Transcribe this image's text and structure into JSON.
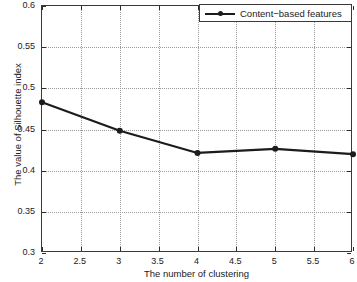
{
  "chart_data": {
    "type": "line",
    "title": "",
    "xlabel": "The number of clustering",
    "ylabel": "The value of Silhouette index",
    "xlim": [
      2,
      6
    ],
    "ylim": [
      0.3,
      0.6
    ],
    "grid": true,
    "legend_position": "top-right",
    "xticks": [
      "2",
      "2.5",
      "3",
      "3.5",
      "4",
      "4.5",
      "5",
      "5.5",
      "6"
    ],
    "xtick_values": [
      2,
      2.5,
      3,
      3.5,
      4,
      4.5,
      5,
      5.5,
      6
    ],
    "yticks": [
      "0.3",
      "0.35",
      "0.4",
      "0.45",
      "0.5",
      "0.55",
      "0.6"
    ],
    "ytick_values": [
      0.3,
      0.35,
      0.4,
      0.45,
      0.5,
      0.55,
      0.6
    ],
    "x": [
      2,
      3,
      4,
      5,
      6
    ],
    "series": [
      {
        "name": "Content−based features",
        "color": "#1c1c1c",
        "marker": "circle",
        "values": [
          0.483,
          0.4485,
          0.4215,
          0.4265,
          0.42
        ]
      }
    ],
    "legend": [
      "Content−based features"
    ]
  }
}
